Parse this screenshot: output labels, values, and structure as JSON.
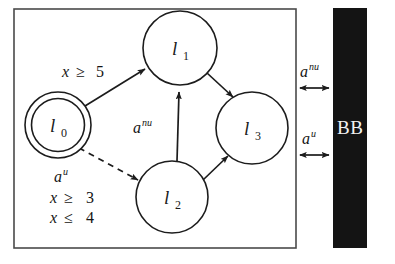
{
  "diagram": {
    "type": "state-transition-diagram",
    "colors": {
      "background": "#ffffff",
      "stroke": "#1c1c1c",
      "box_stroke": "#4a4a4a",
      "bb_fill": "#141414",
      "bb_text": "#f2f2f2"
    },
    "nodes": [
      {
        "id": "l0",
        "label_base": "l",
        "label_sub": "0",
        "cx": 58,
        "cy": 125,
        "r": 33,
        "initial": true,
        "double_circle": true
      },
      {
        "id": "l1",
        "label_base": "l",
        "label_sub": "1",
        "cx": 180,
        "cy": 48,
        "r": 37,
        "initial": false,
        "double_circle": false
      },
      {
        "id": "l2",
        "label_base": "l",
        "label_sub": "2",
        "cx": 172,
        "cy": 197,
        "r": 36,
        "initial": false,
        "double_circle": false
      },
      {
        "id": "l3",
        "label_base": "l",
        "label_sub": "3",
        "cx": 252,
        "cy": 128,
        "r": 36,
        "initial": false,
        "double_circle": false
      }
    ],
    "edges": [
      {
        "id": "e-l0-l1",
        "from": "l0",
        "to": "l1",
        "style": "solid",
        "label": "x ≥ 5"
      },
      {
        "id": "e-l0-l2",
        "from": "l0",
        "to": "l2",
        "style": "dashed",
        "label": "a^u, x ≥ 3, x ≤ 4"
      },
      {
        "id": "e-l2-l1",
        "from": "l2",
        "to": "l1",
        "style": "solid",
        "label": "a^nu"
      },
      {
        "id": "e-l1-l3",
        "from": "l1",
        "to": "l3",
        "style": "solid",
        "label": ""
      },
      {
        "id": "e-l2-l3",
        "from": "l2",
        "to": "l3",
        "style": "solid",
        "label": ""
      }
    ],
    "edge_labels": {
      "guard_x_ge_5": {
        "var": "x",
        "op": "≥",
        "value": "5"
      },
      "action_nu_vertical": {
        "base": "a",
        "sup": "nu"
      },
      "dashed_guard": {
        "action": {
          "base": "a",
          "sup": "u"
        },
        "line2": {
          "var": "x",
          "op": "≥",
          "value": "3"
        },
        "line3": {
          "var": "x",
          "op": "≤",
          "value": "4"
        }
      }
    },
    "black_box": {
      "label": "BB",
      "x": 333,
      "y": 8,
      "width": 34,
      "height": 240
    },
    "bb_channels": [
      {
        "id": "ch-anu",
        "base": "a",
        "sup": "nu",
        "y": 88,
        "x_start": 296,
        "x_end": 333,
        "bidirectional": true
      },
      {
        "id": "ch-au",
        "base": "a",
        "sup": "u",
        "y": 155,
        "x_start": 296,
        "x_end": 333,
        "bidirectional": true
      }
    ],
    "outer_box": {
      "x": 14,
      "y": 9,
      "width": 282,
      "height": 239
    }
  }
}
